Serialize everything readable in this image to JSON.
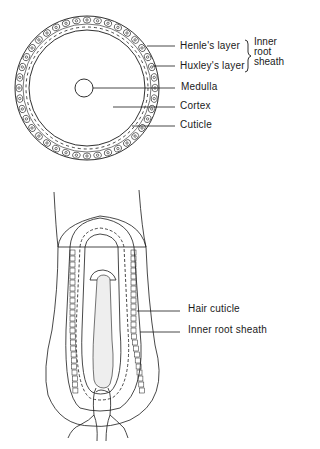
{
  "cross_section": {
    "title": "Hair follicle cross-section",
    "labels": [
      {
        "text": "Henle's layer",
        "y": 40
      },
      {
        "text": "Huxley's layer",
        "y": 60
      },
      {
        "text": "Medulla",
        "y": 81
      },
      {
        "text": "Cortex",
        "y": 100
      },
      {
        "text": "Cuticle",
        "y": 119
      }
    ],
    "group_label": {
      "lines": [
        "Inner",
        "root",
        "sheath"
      ]
    }
  },
  "longitudinal_section": {
    "title": "Hair follicle longitudinal section",
    "labels": [
      {
        "text": "Hair cuticle",
        "y": 303
      },
      {
        "text": "Inner root sheath",
        "y": 324
      }
    ]
  },
  "colors": {
    "line": "#1a1a1a",
    "background": "#ffffff",
    "papilla_fill": "#eeeeee"
  }
}
